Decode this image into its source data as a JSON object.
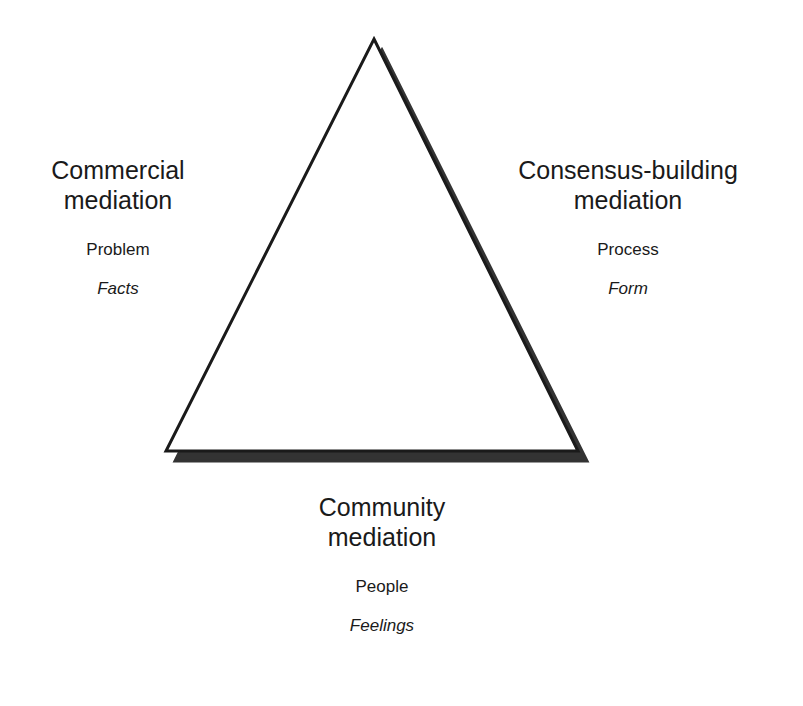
{
  "diagram": {
    "shape": "triangle",
    "colors": {
      "stroke": "#1a1a1a",
      "shadow": "#333333",
      "fill": "#ffffff",
      "background": "#ffffff"
    },
    "vertices": {
      "apex": [
        374,
        39
      ],
      "bottom_left": [
        166,
        448
      ],
      "bottom_right": [
        578,
        452
      ]
    },
    "shadow_offset": [
      8,
      10
    ],
    "corners": [
      {
        "position": "left",
        "title_line1": "Commercial",
        "title_line2": "mediation",
        "focus": "Problem",
        "emphasis": "Facts"
      },
      {
        "position": "right",
        "title_line1": "Consensus-building",
        "title_line2": "mediation",
        "focus": "Process",
        "emphasis": "Form"
      },
      {
        "position": "bottom",
        "title_line1": "Community",
        "title_line2": "mediation",
        "focus": "People",
        "emphasis": "Feelings"
      }
    ]
  }
}
